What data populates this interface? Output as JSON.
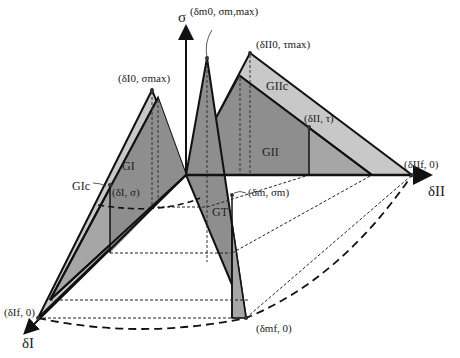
{
  "figure": {
    "axes": {
      "vertical": "σ",
      "mode_I": "δI",
      "mode_II": "δII"
    },
    "points": {
      "mode_I_peak": "(δI0, σmax)",
      "mixed_peak": "(δm0, σm,max)",
      "mode_II_peak": "(δII0, τmax)",
      "mode_II_current": "(δII, τ)",
      "mode_I_current": "(δI, σ)",
      "mixed_current": "(δm, σm)",
      "mode_II_final": "(δIIf, 0)",
      "mode_I_final": "(δIf, 0)",
      "mixed_final": "(δmf, 0)"
    },
    "areas": {
      "mode_I_critical": "GIc",
      "mode_I_energy": "GI",
      "mode_II_critical": "GIIc",
      "mode_II_energy": "GII",
      "total_energy": "GT"
    },
    "colors": {
      "light_fill": "#c8c8c8",
      "mid_fill": "#a6a6a6",
      "dark_fill": "#8e8e8e",
      "stroke": "#111111"
    }
  }
}
